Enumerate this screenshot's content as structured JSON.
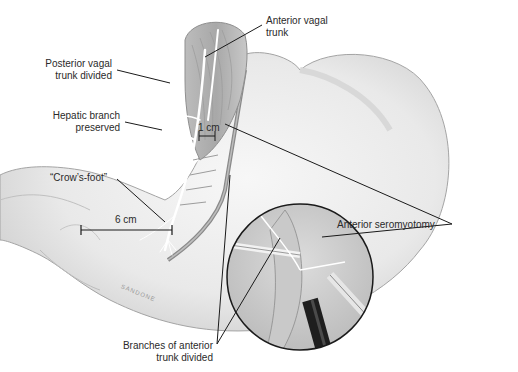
{
  "figure": {
    "colors": {
      "background": "#ffffff",
      "stomach_fill": "#ececec",
      "stomach_outline": "#9a9a9a",
      "nerve": "#ffffff",
      "leader_line": "#1a1a1a",
      "text": "#2a2a2a",
      "inset_border": "#1a1a1a",
      "instrument_dark": "#1e1e1e"
    }
  },
  "labels": {
    "posterior_vagal": {
      "line1": "Posterior vagal",
      "line2": "trunk divided"
    },
    "anterior_vagal": {
      "line1": "Anterior vagal",
      "line2": "trunk"
    },
    "hepatic_branch": {
      "line1": "Hepatic branch",
      "line2": "preserved"
    },
    "crows_foot": {
      "line1": "“Crow’s-foot”"
    },
    "anterior_seromyotomy": {
      "line1": "Anterior seromyotomy"
    },
    "branches_anterior": {
      "line1": "Branches of anterior",
      "line2": "trunk divided"
    }
  },
  "scale_bars": {
    "one_cm": "1 cm",
    "six_cm": "6 cm"
  },
  "signature": "SANDONE"
}
